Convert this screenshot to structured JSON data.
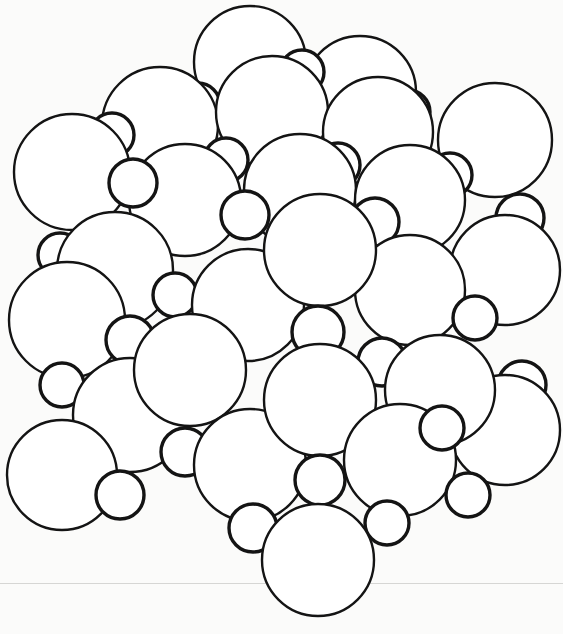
{
  "figure": {
    "type": "crystal-lattice-sphere-packing",
    "colors": {
      "background": "#fbfbfa",
      "sphere_fill": "#ffffff",
      "sphere_stroke": "#141414"
    },
    "large_radius": 56,
    "small_radius": 24,
    "spheres_back_to_front": [
      {
        "cx": 250,
        "cy": 62,
        "r": 56,
        "kind": "large"
      },
      {
        "cx": 360,
        "cy": 92,
        "r": 56,
        "kind": "large"
      },
      {
        "cx": 302,
        "cy": 72,
        "r": 22,
        "kind": "small"
      },
      {
        "cx": 198,
        "cy": 105,
        "r": 22,
        "kind": "small"
      },
      {
        "cx": 408,
        "cy": 112,
        "r": 22,
        "kind": "small"
      },
      {
        "cx": 160,
        "cy": 125,
        "r": 58,
        "kind": "large"
      },
      {
        "cx": 272,
        "cy": 112,
        "r": 56,
        "kind": "large"
      },
      {
        "cx": 378,
        "cy": 132,
        "r": 55,
        "kind": "large"
      },
      {
        "cx": 495,
        "cy": 140,
        "r": 57,
        "kind": "large"
      },
      {
        "cx": 112,
        "cy": 135,
        "r": 22,
        "kind": "small"
      },
      {
        "cx": 226,
        "cy": 160,
        "r": 22,
        "kind": "small"
      },
      {
        "cx": 338,
        "cy": 165,
        "r": 22,
        "kind": "small"
      },
      {
        "cx": 450,
        "cy": 175,
        "r": 22,
        "kind": "small"
      },
      {
        "cx": 72,
        "cy": 172,
        "r": 58,
        "kind": "large"
      },
      {
        "cx": 185,
        "cy": 200,
        "r": 56,
        "kind": "large"
      },
      {
        "cx": 300,
        "cy": 190,
        "r": 56,
        "kind": "large"
      },
      {
        "cx": 410,
        "cy": 200,
        "r": 55,
        "kind": "large"
      },
      {
        "cx": 133,
        "cy": 183,
        "r": 24,
        "kind": "small"
      },
      {
        "cx": 245,
        "cy": 215,
        "r": 24,
        "kind": "small"
      },
      {
        "cx": 375,
        "cy": 222,
        "r": 24,
        "kind": "small"
      },
      {
        "cx": 520,
        "cy": 218,
        "r": 24,
        "kind": "small"
      },
      {
        "cx": 505,
        "cy": 270,
        "r": 55,
        "kind": "large"
      },
      {
        "cx": 60,
        "cy": 255,
        "r": 22,
        "kind": "small"
      },
      {
        "cx": 115,
        "cy": 270,
        "r": 58,
        "kind": "large"
      },
      {
        "cx": 410,
        "cy": 290,
        "r": 55,
        "kind": "large"
      },
      {
        "cx": 175,
        "cy": 295,
        "r": 22,
        "kind": "small"
      },
      {
        "cx": 475,
        "cy": 318,
        "r": 22,
        "kind": "small"
      },
      {
        "cx": 67,
        "cy": 320,
        "r": 58,
        "kind": "large"
      },
      {
        "cx": 248,
        "cy": 305,
        "r": 56,
        "kind": "large"
      },
      {
        "cx": 320,
        "cy": 250,
        "r": 56,
        "kind": "large"
      },
      {
        "cx": 318,
        "cy": 332,
        "r": 26,
        "kind": "small"
      },
      {
        "cx": 130,
        "cy": 340,
        "r": 24,
        "kind": "small"
      },
      {
        "cx": 382,
        "cy": 362,
        "r": 24,
        "kind": "small"
      },
      {
        "cx": 522,
        "cy": 385,
        "r": 24,
        "kind": "small"
      },
      {
        "cx": 505,
        "cy": 430,
        "r": 55,
        "kind": "large"
      },
      {
        "cx": 440,
        "cy": 390,
        "r": 55,
        "kind": "large"
      },
      {
        "cx": 62,
        "cy": 385,
        "r": 22,
        "kind": "small"
      },
      {
        "cx": 130,
        "cy": 415,
        "r": 57,
        "kind": "large"
      },
      {
        "cx": 190,
        "cy": 370,
        "r": 56,
        "kind": "large"
      },
      {
        "cx": 185,
        "cy": 452,
        "r": 24,
        "kind": "small"
      },
      {
        "cx": 62,
        "cy": 475,
        "r": 55,
        "kind": "large"
      },
      {
        "cx": 120,
        "cy": 495,
        "r": 24,
        "kind": "small"
      },
      {
        "cx": 250,
        "cy": 465,
        "r": 56,
        "kind": "large"
      },
      {
        "cx": 320,
        "cy": 400,
        "r": 56,
        "kind": "large"
      },
      {
        "cx": 400,
        "cy": 460,
        "r": 56,
        "kind": "large"
      },
      {
        "cx": 442,
        "cy": 428,
        "r": 22,
        "kind": "small"
      },
      {
        "cx": 468,
        "cy": 495,
        "r": 22,
        "kind": "small"
      },
      {
        "cx": 320,
        "cy": 480,
        "r": 25,
        "kind": "small"
      },
      {
        "cx": 387,
        "cy": 523,
        "r": 22,
        "kind": "small"
      },
      {
        "cx": 253,
        "cy": 528,
        "r": 24,
        "kind": "small"
      },
      {
        "cx": 318,
        "cy": 560,
        "r": 56,
        "kind": "large"
      }
    ]
  }
}
